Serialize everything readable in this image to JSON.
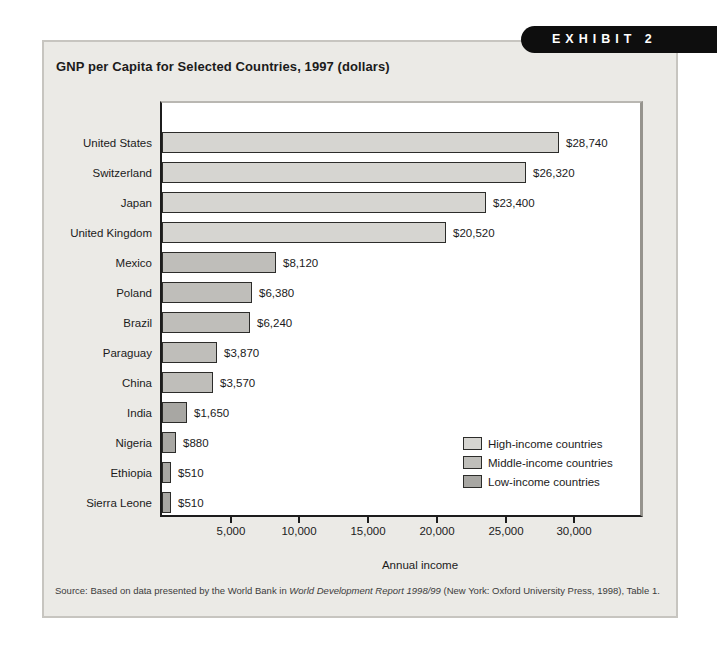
{
  "exhibit": {
    "label": "EXHIBIT 2"
  },
  "title": "GNP per Capita for Selected Countries, 1997 (dollars)",
  "chart_data": {
    "type": "bar",
    "orientation": "horizontal",
    "title": "GNP per Capita for Selected Countries, 1997 (dollars)",
    "categories": [
      "United States",
      "Switzerland",
      "Japan",
      "United Kingdom",
      "Mexico",
      "Poland",
      "Brazil",
      "Paraguay",
      "China",
      "India",
      "Nigeria",
      "Ethiopia",
      "Sierra Leone"
    ],
    "values": [
      28740,
      26320,
      23400,
      20520,
      8120,
      6380,
      6240,
      3870,
      3570,
      1650,
      880,
      510,
      510
    ],
    "value_labels": [
      "$28,740",
      "$26,320",
      "$23,400",
      "$20,520",
      "$8,120",
      "$6,380",
      "$6,240",
      "$3,870",
      "$3,570",
      "$1,650",
      "$880",
      "$510",
      "$510"
    ],
    "groups": [
      "high",
      "high",
      "high",
      "high",
      "middle",
      "middle",
      "middle",
      "middle",
      "middle",
      "low",
      "low",
      "low",
      "low"
    ],
    "xlabel": "Annual income",
    "xlim": [
      0,
      35000
    ],
    "xticks": [
      5000,
      10000,
      15000,
      20000,
      25000,
      30000
    ],
    "xtick_labels": [
      "5,000",
      "10,000",
      "15,000",
      "20,000",
      "25,000",
      "30,000"
    ],
    "grid": false,
    "legend_position": "inside-lower-right",
    "legend": [
      {
        "group": "high",
        "label": "High-income countries"
      },
      {
        "group": "middle",
        "label": "Middle-income countries"
      },
      {
        "group": "low",
        "label": "Low-income countries"
      }
    ]
  },
  "colors": {
    "high": "#d6d5d1",
    "middle": "#bfbeba",
    "low": "#a8a7a3",
    "bar_border": "#2c2c2a",
    "panel_bg": "#ebeae6",
    "tab_bg": "#0e0e0e",
    "tab_text": "#ffffff"
  },
  "source": {
    "prefix": "Source: Based on data presented by the World Bank in ",
    "italic": "World Development Report 1998/99",
    "suffix": " (New York: Oxford University Press, 1998), Table 1."
  }
}
